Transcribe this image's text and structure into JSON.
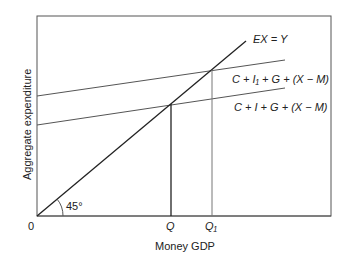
{
  "diagram": {
    "type": "45-degree line aggregate expenditure diagram",
    "axes": {
      "ylabel": "Aggregate expenditure",
      "xlabel": "Money GDP",
      "origin_label": "0"
    },
    "lines": {
      "ex_y": "EX = Y",
      "ae_high": "C + I₁ + G + (X − M)",
      "ae_low": "C + I + G + (X − M)"
    },
    "angle_label": "45°",
    "x_markers": [
      "Q",
      "Q₁"
    ],
    "colors": {
      "frame": "#555555",
      "line": "#222222",
      "guide": "#777777"
    }
  }
}
